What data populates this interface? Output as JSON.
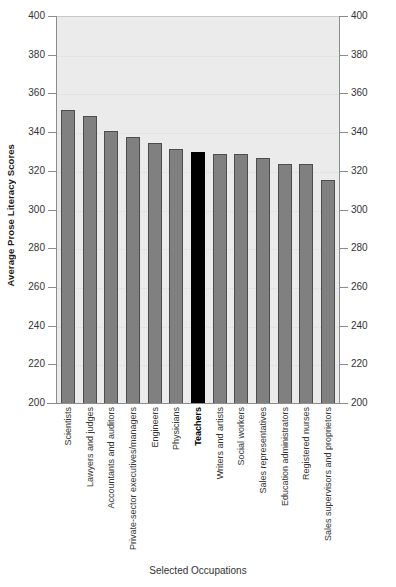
{
  "chart_data": {
    "type": "bar",
    "title": "",
    "xlabel": "Selected Occupations",
    "ylabel": "Average Prose Literacy Scores",
    "ylim": [
      200,
      400
    ],
    "ytick_step": 20,
    "yticks": [
      400,
      380,
      360,
      340,
      320,
      300,
      280,
      260,
      240,
      220,
      200
    ],
    "grid": true,
    "legend": "none",
    "dual_axis": true,
    "highlight_category": "Teachers",
    "colors": {
      "bar": "#808080",
      "bar_outline": "#4d4d4d",
      "highlight_bar": "#000000",
      "plot_background": "#ebebeb",
      "gridline": "#dcdcdc",
      "axis": "#8c8c8c",
      "text": "#333333"
    },
    "categories": [
      "Scientists",
      "Lawyers and judges",
      "Accountants and auditors",
      "Private-sector executives/managers",
      "Engineers",
      "Physicians",
      "Teachers",
      "Writers and artists",
      "Social workers",
      "Sales representatives",
      "Education administrators",
      "Registered nurses",
      "Sales supervisors and proprietors"
    ],
    "values": [
      352,
      349,
      341,
      338,
      335,
      332,
      330,
      329,
      329,
      327,
      324,
      324,
      316
    ]
  }
}
